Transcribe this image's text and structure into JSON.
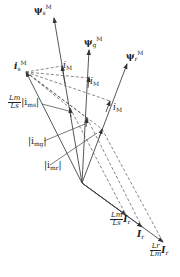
{
  "diagram": {
    "type": "phasor-diagram",
    "colors": {
      "line": "#444444",
      "text": "#222222",
      "background": "#ffffff"
    },
    "vectors": [
      {
        "id": "psi_s",
        "symbol": "ψ",
        "sub": "s",
        "sup": "M"
      },
      {
        "id": "psi_g",
        "symbol": "ψ",
        "sub": "g",
        "sup": "M"
      },
      {
        "id": "psi_r",
        "symbol": "ψ",
        "sub": "r",
        "sup": "M"
      },
      {
        "id": "i_s",
        "symbol": "i",
        "sub": "s",
        "sup": "M"
      }
    ],
    "labels": {
      "psi_s": {
        "main": "ψ",
        "sub": "s",
        "sup": "M"
      },
      "psi_g": {
        "main": "ψ",
        "sub": "g",
        "sup": "M"
      },
      "psi_r": {
        "main": "ψ",
        "sub": "r",
        "sup": "M"
      },
      "i_s": {
        "main": "i",
        "sub": "s",
        "sup": "M"
      },
      "iM_1": {
        "main": "i",
        "sub": "M"
      },
      "iM_2": {
        "main": "i",
        "sub": "M"
      },
      "iM_3": {
        "main": "i",
        "sub": "M"
      },
      "ims": {
        "frac_num": "Lm",
        "frac_den": "Ls",
        "text": "|i",
        "sub": "ms",
        "close": "|"
      },
      "img": {
        "text": "|i",
        "sub": "mg",
        "close": "|"
      },
      "imr": {
        "text": "|i",
        "sub": "mr",
        "close": "|"
      },
      "Ir_scaled_s": {
        "frac_num": "Lm",
        "frac_den": "Ls",
        "text": "I",
        "sub": "r"
      },
      "Ir": {
        "text": "I",
        "sub": "r"
      },
      "Ir_scaled_r": {
        "frac_num": "Lr",
        "frac_den": "Lm",
        "text": "I",
        "sub": "r"
      }
    }
  }
}
